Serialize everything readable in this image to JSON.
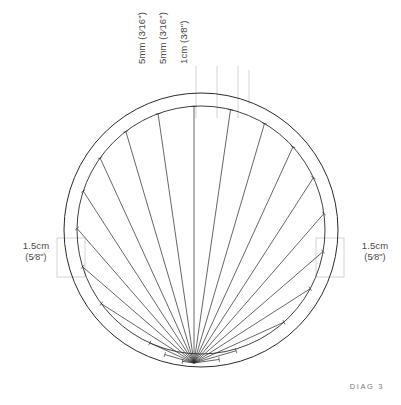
{
  "diagram": {
    "caption": "DIAG 3",
    "background_color": "#ffffff",
    "stroke_color": "#2b2b2b",
    "guide_color": "#c9c9c9",
    "text_color": "#4a4a4a",
    "top_callouts": [
      {
        "id": "seam-allowance-1",
        "value": "5mm",
        "imperial": "(3⁄16\")",
        "leader_x": 196
      },
      {
        "id": "seam-allowance-2",
        "value": "5mm",
        "imperial": "(3⁄16\")",
        "leader_x": 217
      },
      {
        "id": "pleat-depth",
        "value": "1cm",
        "imperial": "(3⁄8\")",
        "leader_x": 238
      }
    ],
    "side_callouts": [
      {
        "id": "band-width-left",
        "value": "1.5cm",
        "imperial": "(5⁄8\")",
        "side": "left"
      },
      {
        "id": "band-width-right",
        "value": "1.5cm",
        "imperial": "(5⁄8\")",
        "side": "right"
      }
    ],
    "geometry": {
      "center_x": 201,
      "center_y": 230,
      "outer_radius": 137,
      "inner_radius": 124,
      "hub_x": 194,
      "hub_y": 363,
      "ray_count": 21,
      "fan_start_deg": 188,
      "fan_end_deg": 352
    }
  }
}
